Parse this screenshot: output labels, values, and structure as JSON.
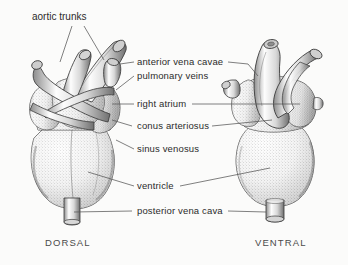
{
  "figure": {
    "background_color": "#fbfbfa",
    "ink_color": "#2b2b2b",
    "line_color": "#555555"
  },
  "labels": {
    "aortic_trunks": "aortic trunks",
    "anterior_vena_cavae": "anterior vena cavae",
    "pulmonary_veins": "pulmonary veins",
    "right_atrium": "right atrium",
    "conus_arteriosus": "conus arteriosus",
    "sinus_venosus": "sinus venosus",
    "ventricle": "ventricle",
    "posterior_vena_cava": "posterior vena cava"
  },
  "captions": {
    "dorsal": "DORSAL",
    "ventral": "VENTRAL"
  }
}
